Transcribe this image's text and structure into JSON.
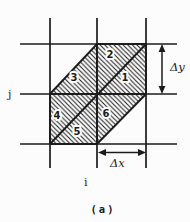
{
  "diagram": {
    "caption": "(a)",
    "axis_labels": {
      "vertical": "j",
      "horizontal": "i"
    },
    "spacing_labels": {
      "dy": "Δy",
      "dx": "Δx"
    },
    "triangle_labels": [
      "1",
      "2",
      "3",
      "4",
      "5",
      "6"
    ],
    "colors": {
      "ink": "#1c1c1c",
      "background": "#fcfcfc"
    }
  }
}
